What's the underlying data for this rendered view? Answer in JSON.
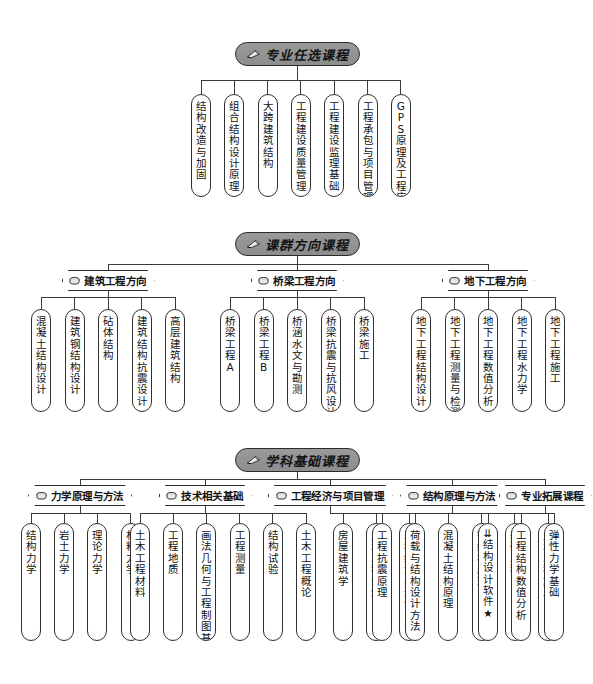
{
  "diagram": {
    "colors": {
      "header_fill": "#9a9a9a",
      "stroke": "#2b2b2b",
      "box_fill": "#ffffff",
      "text": "#141414"
    },
    "icons": {
      "section": "pen-icon",
      "subcategory": "cup-icon",
      "marker_arrow": "⇊",
      "marker_star": "★"
    }
  },
  "sections": [
    {
      "id": "elective",
      "label": "专业任选课程",
      "courses": [
        "结构改造与加固",
        "组合结构设计原理",
        "大跨建筑结构",
        "工程建设质量管理",
        "工程建设监理基础",
        "工程承包与项目管理",
        "GPS原理及工程应用"
      ]
    },
    {
      "id": "direction",
      "label": "课群方向课程",
      "groups": [
        {
          "label": "建筑工程方向",
          "courses": [
            "混凝土结构设计",
            "建筑钢结构设计",
            "砧体结构",
            "建筑结构抗震设计",
            "高层建筑结构"
          ]
        },
        {
          "label": "桥梁工程方向",
          "courses": [
            "桥梁工程A",
            "桥梁工程B",
            "桥涵水文与勘测",
            "桥梁抗震与抗风设计",
            "桥梁施工"
          ]
        },
        {
          "label": "地下工程方向",
          "courses": [
            "地下工程结构设计",
            "地下工程测量与检测",
            "地下工程数值分析",
            "地下工程水力学",
            "地下工程施工"
          ]
        }
      ]
    },
    {
      "id": "foundation",
      "label": "学科基础课程",
      "groups": [
        {
          "label": "力学原理与方法",
          "courses": [
            "结构力学",
            "岩土力学",
            "理论力学",
            "材料力学"
          ]
        },
        {
          "label": "技术相关基础",
          "courses": [
            "土木工程材料",
            "工程地质",
            "画法几何与工程制图基础",
            "工程测量",
            "结构试验",
            "土木工程概论"
          ]
        },
        {
          "label": "工程经济与项目管理",
          "courses": [
            "房屋建筑学",
            "土木工程法规",
            "工程经济与造价"
          ]
        },
        {
          "label": "结构原理与方法",
          "courses": [
            "工程抗震原理",
            "荷载与结构设计方法",
            "混凝土结构原理",
            "钢结构原理",
            "基础工程",
            "土木工程施工"
          ]
        },
        {
          "label": "专业拓展课程",
          "courses": [
            "⇊结构设计软件★",
            "工程结构数值分析",
            "弹性力学基础"
          ]
        }
      ]
    }
  ]
}
